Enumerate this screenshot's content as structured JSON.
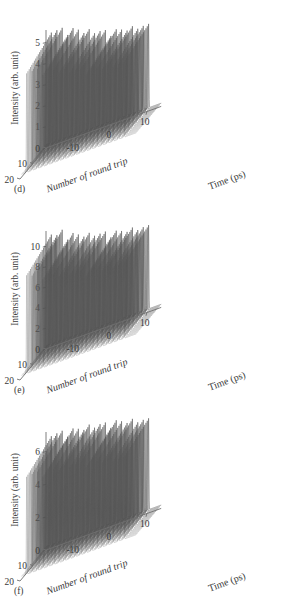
{
  "figure": {
    "background": "#ffffff",
    "ink": "#3a3a3a",
    "axis_color": "#6f6f6f",
    "trace_color": "#555555"
  },
  "panels": [
    {
      "tag": "(d)",
      "ylabel": "Intensity (arb. unit)",
      "xlabel": "Time (ps)",
      "zlabel": "Number of round trip",
      "ytick_labels": [
        "5",
        "4",
        "3",
        "2",
        "1"
      ],
      "ytick_values": [
        5,
        4,
        3,
        2,
        1
      ],
      "xtick_labels": [
        "-10",
        "0",
        "10"
      ],
      "xtick_values": [
        -10,
        0,
        10
      ],
      "ztick_labels": [
        "20",
        "10",
        "0"
      ],
      "ztick_values": [
        20,
        10,
        0
      ]
    },
    {
      "tag": "(e)",
      "ylabel": "Intensity (arb. unit)",
      "xlabel": "Time (ps)",
      "zlabel": "Number of round trip",
      "ytick_labels": [
        "10",
        "8",
        "6",
        "4",
        "2"
      ],
      "ytick_values": [
        10,
        8,
        6,
        4,
        2
      ],
      "xtick_labels": [
        "-10",
        "0",
        "10"
      ],
      "xtick_values": [
        -10,
        0,
        10
      ],
      "ztick_labels": [
        "20",
        "10",
        "0"
      ],
      "ztick_values": [
        20,
        10,
        0
      ]
    },
    {
      "tag": "(f)",
      "ylabel": "Intensity (arb. unit)",
      "xlabel": "Time (ps)",
      "zlabel": "Number of round trip",
      "ytick_labels": [
        "6",
        "4",
        "2"
      ],
      "ytick_values": [
        6,
        4,
        2
      ],
      "xtick_labels": [
        "-10",
        "0",
        "10"
      ],
      "xtick_values": [
        -10,
        0,
        10
      ],
      "ztick_labels": [
        "20",
        "10",
        "0"
      ],
      "ztick_values": [
        20,
        10,
        0
      ]
    }
  ],
  "chart_data": [
    {
      "type": "line",
      "title": "(d)",
      "xlabel": "Time (ps)",
      "ylabel": "Intensity (arb. unit)",
      "zlabel": "Number of round trip",
      "xlim": [
        -18,
        14
      ],
      "ylim": [
        0,
        5.6
      ],
      "zlim": [
        0,
        20
      ],
      "grid": false,
      "legend": "none",
      "projection": "3d-waterfall",
      "n_traces": 20,
      "n_pulses_per_trace": 19,
      "pulse_period_ps": 1.5,
      "pulse_train_start_ps": -16.5,
      "baseline": 0.15,
      "peak_heights": [
        5.6,
        5.5,
        5.45,
        5.35,
        5.25,
        5.15,
        5.0,
        4.9,
        4.8,
        4.7,
        4.6,
        4.5,
        4.45,
        4.4,
        4.35,
        4.3,
        4.25,
        4.2,
        4.15
      ],
      "trace_amplitude_scale": [
        1.0,
        0.99,
        0.985,
        0.98,
        0.975,
        0.97,
        0.965,
        0.96,
        0.955,
        0.95,
        0.945,
        0.94,
        0.935,
        0.93,
        0.925,
        0.92,
        0.915,
        0.91,
        0.905,
        0.9
      ],
      "description": "Waterfall of 20 successive round trips; each trip shows a periodic pulse train whose envelope decays slowly from left to right."
    },
    {
      "type": "line",
      "title": "(e)",
      "xlabel": "Time (ps)",
      "ylabel": "Intensity (arb. unit)",
      "zlabel": "Number of round trip",
      "xlim": [
        -18,
        14
      ],
      "ylim": [
        0,
        11.5
      ],
      "zlim": [
        0,
        20
      ],
      "grid": false,
      "legend": "none",
      "projection": "3d-waterfall",
      "n_traces": 20,
      "n_pulses_per_trace": 19,
      "pulse_period_ps": 1.5,
      "pulse_train_start_ps": -16.5,
      "baseline": 0.3,
      "peak_heights": [
        11.4,
        10.9,
        11.1,
        10.6,
        10.4,
        10.2,
        10.0,
        9.8,
        9.7,
        9.5,
        9.4,
        9.2,
        9.1,
        9.0,
        8.9,
        8.8,
        8.7,
        8.6,
        8.5
      ],
      "trace_amplitude_scale": [
        1.0,
        0.99,
        0.985,
        0.98,
        0.975,
        0.97,
        0.965,
        0.96,
        0.955,
        0.95,
        0.945,
        0.94,
        0.935,
        0.93,
        0.925,
        0.92,
        0.915,
        0.91,
        0.905,
        0.9
      ],
      "description": "Same waterfall geometry with roughly double the peak intensity scale; envelope decay is shallower."
    },
    {
      "type": "line",
      "title": "(f)",
      "xlabel": "Time (ps)",
      "ylabel": "Intensity (arb. unit)",
      "zlabel": "Number of round trip",
      "xlim": [
        -18,
        14
      ],
      "ylim": [
        0,
        7.2
      ],
      "zlim": [
        0,
        20
      ],
      "grid": false,
      "legend": "none",
      "projection": "3d-waterfall",
      "n_traces": 20,
      "n_pulses_per_trace": 19,
      "pulse_period_ps": 1.5,
      "pulse_train_start_ps": -16.5,
      "baseline": 0.2,
      "peak_heights": [
        7.1,
        7.0,
        6.95,
        6.9,
        6.85,
        6.8,
        6.75,
        6.7,
        6.65,
        6.6,
        6.5,
        6.45,
        6.4,
        6.3,
        6.2,
        6.1,
        6.0,
        5.9,
        5.8
      ],
      "trace_amplitude_scale": [
        1.0,
        0.99,
        0.985,
        0.98,
        0.975,
        0.97,
        0.965,
        0.96,
        0.955,
        0.95,
        0.945,
        0.94,
        0.935,
        0.93,
        0.925,
        0.92,
        0.915,
        0.91,
        0.905,
        0.9
      ],
      "description": "Waterfall with the most uniform pulse train; peaks stay near 6-7 across the whole window."
    }
  ]
}
